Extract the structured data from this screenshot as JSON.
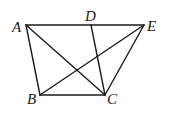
{
  "diagram": {
    "type": "geometry-figure",
    "points": {
      "A": {
        "label": "A",
        "x": 26,
        "y": 25
      },
      "D": {
        "label": "D",
        "x": 91,
        "y": 25
      },
      "E": {
        "label": "E",
        "x": 144,
        "y": 25
      },
      "B": {
        "label": "B",
        "x": 40,
        "y": 95
      },
      "C": {
        "label": "C",
        "x": 105,
        "y": 95
      }
    },
    "segments": [
      [
        "A",
        "E"
      ],
      [
        "A",
        "B"
      ],
      [
        "B",
        "C"
      ],
      [
        "C",
        "E"
      ],
      [
        "A",
        "C"
      ],
      [
        "B",
        "E"
      ],
      [
        "D",
        "C"
      ]
    ],
    "stroke_color": "#1a1a1a"
  }
}
